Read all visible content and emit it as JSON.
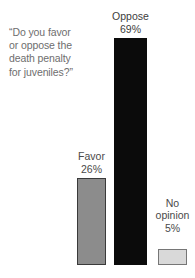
{
  "chart_data": {
    "type": "bar",
    "title": "",
    "subtitle": "",
    "question": "“Do you favor\nor oppose the\ndeath penalty\nfor juveniles?”",
    "categories": [
      "Favor",
      "Oppose",
      "No opinion"
    ],
    "values": [
      26,
      69,
      5
    ],
    "value_labels": [
      "26%",
      "69%",
      "5%"
    ],
    "unit": "%",
    "xlabel": "",
    "ylabel": "",
    "ylim": [
      0,
      69
    ],
    "grid": false,
    "legend": false,
    "axes_visible": false,
    "background_color": "#ffffff",
    "bars": [
      {
        "category": "Favor",
        "value": 26,
        "value_label": "26%",
        "fill_color": "#8c8c8c",
        "border_color": "#3a3a3a"
      },
      {
        "category": "Oppose",
        "value": 69,
        "value_label": "69%",
        "fill_color": "#0b0b0b",
        "border_color": "#0b0b0b"
      },
      {
        "category": "No opinion",
        "value": 5,
        "value_label": "5%",
        "fill_color": "#d9d9d9",
        "border_color": "#767676"
      }
    ]
  },
  "labels": {
    "favor_name": "Favor",
    "favor_pct": "26%",
    "oppose_name": "Oppose",
    "oppose_pct": "69%",
    "noopinion_name": "No\nopinion",
    "noopinion_pct": "5%"
  },
  "colors": {
    "question_text": "#6e6e6e",
    "label_text": "#4a4a4a",
    "oppose_bar": "#0b0b0b",
    "favor_bar": "#8c8c8c",
    "noopinion_bar": "#d9d9d9"
  }
}
